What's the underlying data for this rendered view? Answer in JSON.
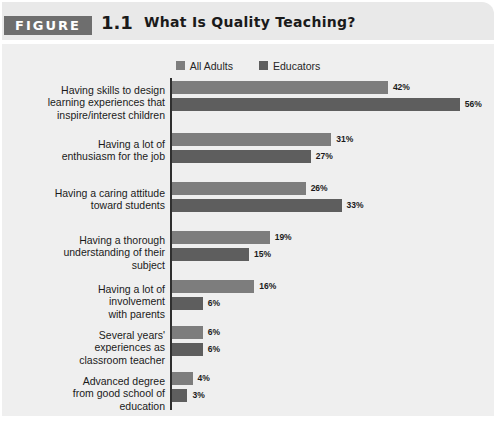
{
  "figure": {
    "tag": "FIGURE",
    "number": "1.1",
    "title": "What Is Quality Teaching?"
  },
  "colors": {
    "series_all_adults": "#7d7d7d",
    "series_educators": "#5e5e5e",
    "panel_background": "#efefef",
    "header_background": "#e9e9e9",
    "tag_background": "#6e6e6e",
    "axis": "#2f2f2f"
  },
  "legend": {
    "position": "top-center",
    "items": [
      {
        "label": "All Adults",
        "color": "#7d7d7d"
      },
      {
        "label": "Educators",
        "color": "#5e5e5e"
      }
    ]
  },
  "chart_data": {
    "type": "bar",
    "orientation": "horizontal",
    "title": "What Is Quality Teaching?",
    "xlabel": "",
    "ylabel": "",
    "xlim": [
      0,
      60
    ],
    "grid": false,
    "value_suffix": "%",
    "categories": [
      "Having skills to design learning experiences that inspire/interest children",
      "Having a lot of enthusiasm for the job",
      "Having a caring attitude toward students",
      "Having a thorough understanding of their subject",
      "Having a lot of involvement with parents",
      "Several years' experiences as classroom teacher",
      "Advanced degree from good school of education"
    ],
    "category_lines": [
      [
        "Having skills to design",
        "learning experiences that",
        "inspire/interest children"
      ],
      [
        "Having a lot of",
        "enthusiasm for the job"
      ],
      [
        "Having a caring attitude",
        "toward students"
      ],
      [
        "Having a thorough",
        "understanding of their",
        "subject"
      ],
      [
        "Having a lot of",
        "involvement",
        "with parents"
      ],
      [
        "Several years'",
        "experiences as",
        "classroom teacher"
      ],
      [
        "Advanced degree",
        "from good school of",
        "education"
      ]
    ],
    "series": [
      {
        "name": "All Adults",
        "color": "#7d7d7d",
        "values": [
          42,
          31,
          26,
          19,
          16,
          6,
          4
        ],
        "labels": [
          "42%",
          "31%",
          "26%",
          "19%",
          "16%",
          "6%",
          "4%"
        ]
      },
      {
        "name": "Educators",
        "color": "#5e5e5e",
        "values": [
          56,
          27,
          33,
          15,
          6,
          6,
          3
        ],
        "labels": [
          "56%",
          "27%",
          "33%",
          "15%",
          "6%",
          "6%",
          "3%"
        ]
      }
    ]
  },
  "layout": {
    "px_per_percent": 5.14,
    "group_tops": [
      5,
      57,
      106,
      155,
      204,
      250,
      296
    ],
    "group_label_tops": [
      8,
      62,
      111,
      158,
      207,
      253,
      299
    ]
  }
}
